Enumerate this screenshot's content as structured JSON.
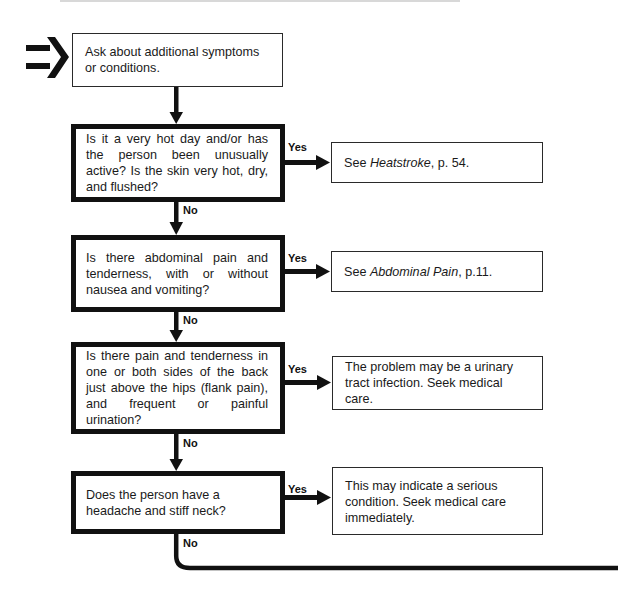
{
  "flowchart": {
    "entry_icon": "double-arrow-right-icon",
    "start": {
      "text": "Ask about additional symptoms or conditions."
    },
    "questions": [
      {
        "text": "Is it a very hot day and/or has the person been unusually active? Is the skin very hot, dry, and flushed?",
        "yes_label": "Yes",
        "no_label": "No",
        "result": {
          "prefix": "See ",
          "ref": "Heatstroke",
          "suffix": ", p. 54."
        }
      },
      {
        "text": "Is there abdominal pain and tenderness, with or without nausea and vomiting?",
        "yes_label": "Yes",
        "no_label": "No",
        "result": {
          "prefix": "See ",
          "ref": "Abdominal Pain",
          "suffix": ", p.11."
        }
      },
      {
        "text": "Is there pain and tenderness in one or both sides of the back just above the hips (flank pain), and frequent or painful urination?",
        "yes_label": "Yes",
        "no_label": "No",
        "result": {
          "text": "The problem may be a urinary tract infection. Seek medical care."
        }
      },
      {
        "text": "Does the person have a headache and stiff neck?",
        "yes_label": "Yes",
        "no_label": "No",
        "result": {
          "text": "This may indicate a serious condition. Seek medical care immediately."
        }
      }
    ],
    "colors": {
      "line": "#111111",
      "background": "#ffffff",
      "text": "#1a1a1a"
    }
  }
}
